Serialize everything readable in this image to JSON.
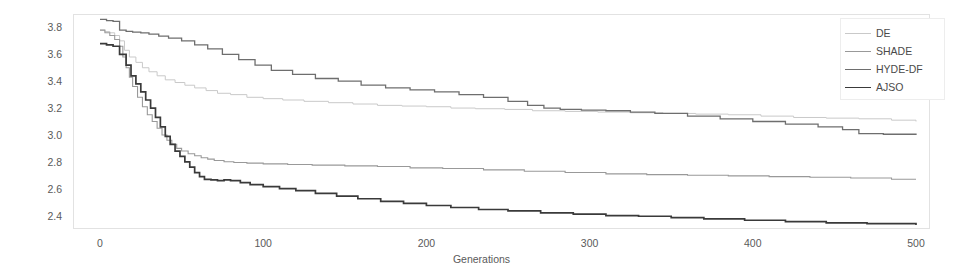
{
  "chart_data": {
    "type": "line",
    "title": "",
    "xlabel": "Generations",
    "ylabel": "",
    "xlim": [
      0,
      500
    ],
    "ylim": [
      2.3,
      3.9
    ],
    "xticks": [
      0,
      100,
      200,
      300,
      400,
      500
    ],
    "yticks": [
      2.4,
      2.6,
      2.8,
      3.0,
      3.2,
      3.4,
      3.6,
      3.8
    ],
    "ytick_labels": [
      "2.4",
      "2.6",
      "2.8",
      "3.0",
      "3.2",
      "3.4",
      "3.6",
      "3.8"
    ],
    "xtick_labels": [
      "0",
      "100",
      "200",
      "300",
      "400",
      "500"
    ],
    "grid": false,
    "legend_position": "top-right",
    "series": [
      {
        "name": "DE",
        "color": "#c9c9c9",
        "width": 1.0,
        "x": [
          0,
          3,
          6,
          9,
          12,
          15,
          18,
          22,
          26,
          30,
          35,
          40,
          46,
          52,
          58,
          65,
          72,
          80,
          90,
          100,
          112,
          125,
          140,
          155,
          170,
          185,
          200,
          215,
          230,
          248,
          265,
          285,
          305,
          325,
          345,
          365,
          385,
          405,
          425,
          445,
          465,
          485,
          500
        ],
        "y": [
          3.78,
          3.77,
          3.76,
          3.74,
          3.7,
          3.63,
          3.58,
          3.54,
          3.5,
          3.47,
          3.44,
          3.41,
          3.39,
          3.37,
          3.35,
          3.33,
          3.31,
          3.3,
          3.28,
          3.27,
          3.26,
          3.25,
          3.24,
          3.23,
          3.22,
          3.215,
          3.21,
          3.2,
          3.195,
          3.19,
          3.18,
          3.175,
          3.17,
          3.165,
          3.16,
          3.155,
          3.15,
          3.14,
          3.13,
          3.125,
          3.12,
          3.11,
          3.1
        ]
      },
      {
        "name": "SHADE",
        "color": "#999999",
        "width": 1.1,
        "x": [
          0,
          3,
          6,
          9,
          12,
          14,
          16,
          18,
          20,
          23,
          26,
          29,
          32,
          35,
          38,
          41,
          44,
          47,
          50,
          54,
          58,
          62,
          66,
          70,
          76,
          82,
          90,
          100,
          115,
          130,
          150,
          170,
          190,
          210,
          235,
          260,
          285,
          310,
          335,
          360,
          385,
          410,
          435,
          460,
          485,
          500
        ],
        "y": [
          3.78,
          3.76,
          3.74,
          3.71,
          3.66,
          3.58,
          3.5,
          3.43,
          3.36,
          3.28,
          3.21,
          3.15,
          3.1,
          3.05,
          3.0,
          2.96,
          2.93,
          2.9,
          2.88,
          2.86,
          2.845,
          2.83,
          2.82,
          2.81,
          2.8,
          2.795,
          2.79,
          2.785,
          2.78,
          2.775,
          2.77,
          2.765,
          2.755,
          2.75,
          2.74,
          2.73,
          2.72,
          2.71,
          2.705,
          2.7,
          2.695,
          2.69,
          2.685,
          2.68,
          2.67,
          2.67
        ]
      },
      {
        "name": "HYDE-DF",
        "color": "#6e6e6e",
        "width": 1.3,
        "x": [
          0,
          4,
          8,
          12,
          16,
          20,
          25,
          30,
          36,
          42,
          50,
          58,
          66,
          75,
          85,
          95,
          105,
          118,
          132,
          146,
          160,
          175,
          190,
          205,
          220,
          235,
          250,
          262,
          272,
          282,
          295,
          310,
          325,
          340,
          360,
          380,
          400,
          420,
          440,
          455,
          465,
          480,
          500
        ],
        "y": [
          3.86,
          3.85,
          3.845,
          3.78,
          3.77,
          3.765,
          3.76,
          3.75,
          3.735,
          3.72,
          3.7,
          3.67,
          3.64,
          3.6,
          3.56,
          3.52,
          3.48,
          3.45,
          3.42,
          3.4,
          3.37,
          3.35,
          3.335,
          3.32,
          3.3,
          3.28,
          3.25,
          3.22,
          3.2,
          3.19,
          3.185,
          3.18,
          3.17,
          3.16,
          3.14,
          3.12,
          3.1,
          3.08,
          3.06,
          3.04,
          3.01,
          3.005,
          3.0
        ]
      },
      {
        "name": "AJSO",
        "color": "#3a3a3a",
        "width": 1.7,
        "x": [
          0,
          4,
          8,
          12,
          16,
          19,
          22,
          25,
          28,
          31,
          34,
          37,
          40,
          43,
          46,
          49,
          52,
          55,
          58,
          61,
          64,
          68,
          72,
          76,
          80,
          86,
          92,
          100,
          110,
          120,
          132,
          145,
          158,
          172,
          186,
          200,
          215,
          232,
          250,
          270,
          290,
          310,
          330,
          350,
          370,
          395,
          420,
          445,
          470,
          500
        ],
        "y": [
          3.68,
          3.67,
          3.66,
          3.6,
          3.52,
          3.44,
          3.38,
          3.32,
          3.26,
          3.2,
          3.13,
          3.06,
          2.99,
          2.93,
          2.88,
          2.84,
          2.8,
          2.76,
          2.72,
          2.69,
          2.67,
          2.665,
          2.66,
          2.665,
          2.66,
          2.645,
          2.63,
          2.615,
          2.6,
          2.585,
          2.565,
          2.545,
          2.525,
          2.505,
          2.49,
          2.475,
          2.46,
          2.445,
          2.435,
          2.42,
          2.41,
          2.4,
          2.395,
          2.385,
          2.375,
          2.365,
          2.355,
          2.345,
          2.34,
          2.33
        ]
      }
    ]
  },
  "legend": {
    "items": [
      {
        "label": "DE"
      },
      {
        "label": "SHADE"
      },
      {
        "label": "HYDE-DF"
      },
      {
        "label": "AJSO"
      }
    ]
  }
}
